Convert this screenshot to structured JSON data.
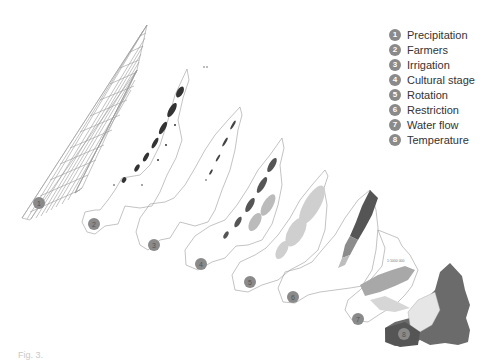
{
  "legend": {
    "items": [
      {
        "number": "1",
        "label": "Precipitation"
      },
      {
        "number": "2",
        "label": "Farmers"
      },
      {
        "number": "3",
        "label": "Irrigation"
      },
      {
        "number": "4",
        "label": "Cultural stage"
      },
      {
        "number": "5",
        "label": "Rotation"
      },
      {
        "number": "6",
        "label": "Restriction"
      },
      {
        "number": "7",
        "label": "Water flow"
      },
      {
        "number": "8",
        "label": "Temperature"
      }
    ]
  },
  "layers": {
    "badges": [
      "1",
      "2",
      "3",
      "4",
      "5",
      "6",
      "7",
      "8"
    ],
    "water_flow_scale_text": "1:1000 000"
  },
  "colors": {
    "badge": "#8a8a8a",
    "outline": "#9a9a9a",
    "dark_fill": "#555555",
    "mid_fill": "#8c8c8c",
    "light_fill": "#c8c8c8"
  },
  "caption": {
    "text": "Fig. 3."
  }
}
